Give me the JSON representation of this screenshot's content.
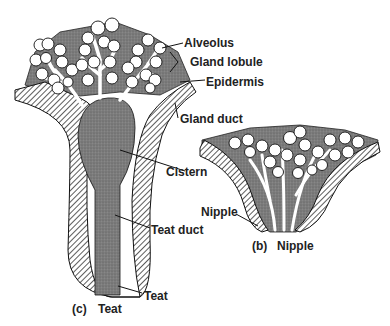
{
  "diagram": {
    "labels": {
      "alveolus": "Alveolus",
      "gland_lobule": "Gland lobule",
      "epidermis": "Epidermis",
      "gland_duct": "Gland duct",
      "cistern": "Cistern",
      "teat_duct": "Teat duct",
      "teat": "Teat",
      "nipple": "Nipple"
    },
    "captions": {
      "c_letter": "(c)",
      "c_text": "Teat",
      "b_letter": "(b)",
      "b_text": "Nipple"
    },
    "colors": {
      "gland_tissue": "#7a7a7a",
      "epidermis_hatch": "#333333",
      "alveolus_fill": "#ffffff",
      "outline": "#111111"
    }
  }
}
